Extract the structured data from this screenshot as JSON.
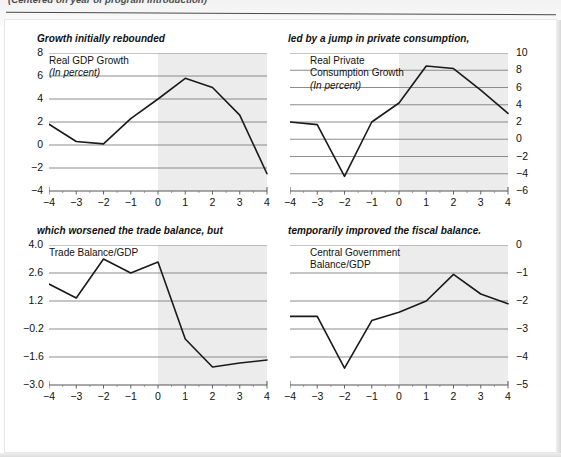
{
  "caption": "(Centered on year of program introduction)",
  "shared": {
    "x_categories": [
      "−4",
      "−3",
      "−2",
      "−1",
      "0",
      "1",
      "2",
      "3",
      "4"
    ],
    "shade_from": 0,
    "shade_color": "#ececec",
    "line_color": "#1a1a1a",
    "grid_color": "#808080"
  },
  "chart_data": [
    {
      "id": "real-gdp-growth",
      "type": "line",
      "title": "Growth initially rebounded",
      "legend": [
        "Real GDP Growth",
        "(In percent)"
      ],
      "legend_italic_lines": [
        1
      ],
      "xlabel": "",
      "ylabel": "",
      "axis_side": "left",
      "x": [
        -4,
        -3,
        -2,
        -1,
        0,
        1,
        2,
        3,
        4
      ],
      "categories": [
        "−4",
        "−3",
        "−2",
        "−1",
        "0",
        "1",
        "2",
        "3",
        "4"
      ],
      "values": [
        1.8,
        0.3,
        0.1,
        2.3,
        4.0,
        5.8,
        5.0,
        2.6,
        -2.5
      ],
      "yticks": [
        8,
        6,
        4,
        2,
        0,
        -2,
        -4
      ],
      "ytick_labels": [
        "8",
        "6",
        "4",
        "2",
        "0",
        "−2",
        "−4"
      ],
      "ylim": [
        -4,
        8
      ],
      "grid": true,
      "legend_position": "inside-top-left",
      "shaded_region": [
        0,
        4
      ]
    },
    {
      "id": "real-private-consumption-growth",
      "type": "line",
      "title": "led by a jump in private consumption,",
      "legend": [
        "Real Private",
        "Consumption Growth",
        "(In percent)"
      ],
      "legend_italic_lines": [
        2
      ],
      "xlabel": "",
      "ylabel": "",
      "axis_side": "right",
      "x": [
        -4,
        -3,
        -2,
        -1,
        0,
        1,
        2,
        3,
        4
      ],
      "categories": [
        "−4",
        "−3",
        "−2",
        "−1",
        "0",
        "1",
        "2",
        "3",
        "4"
      ],
      "values": [
        2.0,
        1.7,
        -4.3,
        2.0,
        4.2,
        8.5,
        8.2,
        5.7,
        3.0
      ],
      "yticks": [
        10,
        8,
        6,
        4,
        2,
        0,
        -2,
        -4,
        -6
      ],
      "ytick_labels": [
        "10",
        "8",
        "6",
        "4",
        "2",
        "0",
        "−2",
        "−4",
        "−6"
      ],
      "ylim": [
        -6,
        10
      ],
      "grid": true,
      "legend_position": "inside-top-left",
      "shaded_region": [
        0,
        4
      ]
    },
    {
      "id": "trade-balance-gdp",
      "type": "line",
      "title": "which worsened the trade balance, but",
      "legend": [
        "Trade Balance/GDP"
      ],
      "legend_italic_lines": [],
      "xlabel": "",
      "ylabel": "",
      "axis_side": "left",
      "x": [
        -4,
        -3,
        -2,
        -1,
        0,
        1,
        2,
        3,
        4
      ],
      "categories": [
        "−4",
        "−3",
        "−2",
        "−1",
        "0",
        "1",
        "2",
        "3",
        "4"
      ],
      "values": [
        2.05,
        1.35,
        3.3,
        2.6,
        3.15,
        -0.7,
        -2.1,
        -1.9,
        -1.75
      ],
      "yticks": [
        4.0,
        2.6,
        1.2,
        -0.2,
        -1.6,
        -3.0
      ],
      "ytick_labels": [
        "4.0",
        "2.6",
        "1.2",
        "−0.2",
        "−1.6",
        "−3.0"
      ],
      "ylim": [
        -3.0,
        4.0
      ],
      "grid": true,
      "legend_position": "inside-top-left",
      "shaded_region": [
        0,
        4
      ]
    },
    {
      "id": "central-government-balance-gdp",
      "type": "line",
      "title": "temporarily improved the fiscal balance.",
      "legend": [
        "Central Government",
        "Balance/GDP"
      ],
      "legend_italic_lines": [],
      "xlabel": "",
      "ylabel": "",
      "axis_side": "right",
      "x": [
        -4,
        -3,
        -2,
        -1,
        0,
        1,
        2,
        3,
        4
      ],
      "categories": [
        "−4",
        "−3",
        "−2",
        "−1",
        "0",
        "1",
        "2",
        "3",
        "4"
      ],
      "values": [
        -2.55,
        -2.55,
        -4.4,
        -2.7,
        -2.4,
        -2.0,
        -1.05,
        -1.75,
        -2.1
      ],
      "yticks": [
        0,
        -1,
        -2,
        -3,
        -4,
        -5
      ],
      "ytick_labels": [
        "0",
        "−1",
        "−2",
        "−3",
        "−4",
        "−5"
      ],
      "ylim": [
        -5,
        0
      ],
      "grid": true,
      "legend_position": "inside-top-left",
      "shaded_region": [
        0,
        4
      ]
    }
  ]
}
